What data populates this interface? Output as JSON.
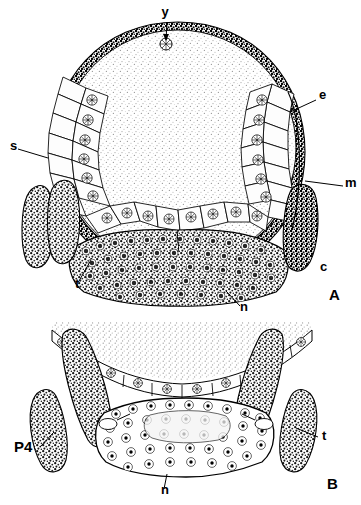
{
  "figure": {
    "type": "scientific-illustration",
    "background_color": "#ffffff",
    "ink_color": "#000000",
    "panels": [
      {
        "id": "A",
        "panel_label": "A",
        "description": "Complete transverse section of the egg: large central yolk mass surrounded by columnar embryonic epithelium, dark serosa, and a ventral mass of germ cells.",
        "labels": [
          {
            "key": "y",
            "text": "y",
            "meaning": "yolk granule",
            "has_leader": true
          },
          {
            "key": "e",
            "text": "e",
            "meaning": "epithelium",
            "has_leader": true
          },
          {
            "key": "m",
            "text": "m",
            "meaning": "membrane",
            "has_leader": true
          },
          {
            "key": "s",
            "text": "s",
            "meaning": "serosa",
            "has_leader": true
          },
          {
            "key": "c",
            "text": "c",
            "meaning": "cuticle",
            "has_leader": false
          },
          {
            "key": "t",
            "text": "t",
            "meaning": "trophocyte lobe",
            "has_leader": true
          },
          {
            "key": "n",
            "text": "n",
            "meaning": "nucleus / germ cell mass",
            "has_leader": true
          }
        ]
      },
      {
        "id": "B",
        "panel_label": "B",
        "description": "Detail of the ventral region: flattened epithelium arc beneath the yolk, lateral lobes and a dense oval germ cell mass.",
        "labels": [
          {
            "key": "P4",
            "text": "P4",
            "meaning": "pole cell group 4",
            "has_leader": true
          },
          {
            "key": "t",
            "text": "t",
            "meaning": "trophocyte lobe",
            "has_leader": true
          },
          {
            "key": "n",
            "text": "n",
            "meaning": "nucleus / germ cell mass",
            "has_leader": true
          }
        ]
      }
    ],
    "label_positions": {
      "a_y": {
        "text": "y",
        "x": 165,
        "y": 16
      },
      "a_e": {
        "text": "e",
        "x": 319,
        "y": 99
      },
      "a_m": {
        "text": "m",
        "x": 345,
        "y": 187
      },
      "a_s": {
        "text": "s",
        "x": 10,
        "y": 150
      },
      "a_c": {
        "text": "c",
        "x": 320,
        "y": 271
      },
      "a_t": {
        "text": "t",
        "x": 75,
        "y": 288
      },
      "a_n": {
        "text": "n",
        "x": 240,
        "y": 311
      },
      "a_panel": {
        "text": "A",
        "x": 329,
        "y": 300
      },
      "b_p4": {
        "text": "P4",
        "x": 14,
        "y": 452
      },
      "b_t": {
        "text": "t",
        "x": 322,
        "y": 440
      },
      "b_n": {
        "text": "n",
        "x": 161,
        "y": 494
      },
      "b_panel": {
        "text": "B",
        "x": 327,
        "y": 489
      }
    }
  }
}
